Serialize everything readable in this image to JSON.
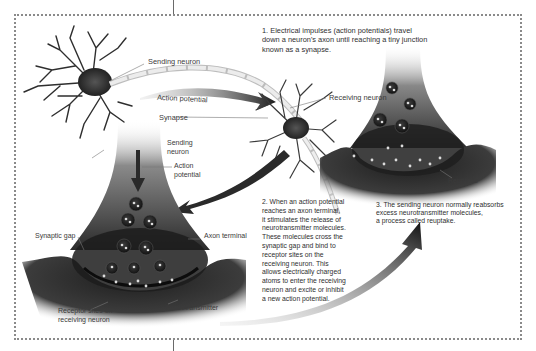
{
  "diagram": {
    "steps": [
      {
        "number": 1,
        "text": "1. Electrical impulses (action potentials) travel\ndown a neuron's axon until reaching a tiny junction\nknown as a synapse."
      },
      {
        "number": 2,
        "text": "2. When an action potential\nreaches an axon terminal,\nit stimulates the release of\nneurotransmitter molecules.\nThese molecules cross the\nsynaptic gap and bind to\nreceptor sites on the\nreceiving neuron. This\nallows electrically charged\natoms to enter the receiving\nneuron and excite or inhibit\na new action potential."
      },
      {
        "number": 3,
        "text": "3. The sending neuron normally reabsorbs\nexcess neurotransmitter molecules,\na process called reuptake."
      }
    ],
    "labels": {
      "sending_neuron_top": "Sending neuron",
      "action_potential_top": "Action potential",
      "synapse": "Synapse",
      "receiving_neuron": "Receiving neuron",
      "sending_neuron_detail": "Sending\nneuron",
      "action_potential_detail": "Action\npotential",
      "synaptic_gap": "Synaptic gap",
      "axon_terminal": "Axon terminal",
      "receptor_sites": "Receptor sites on\nreceiving neuron",
      "neurotransmitter": "Neurotransmitter",
      "reuptake": "Reuptake"
    },
    "colors": {
      "border": "#8a8a8a",
      "neuron_dark": "#2a2a2a",
      "neuron_mid": "#6b6b6b",
      "axon": "#d9d9d9",
      "text": "#333333"
    }
  }
}
